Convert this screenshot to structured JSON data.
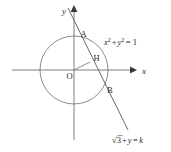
{
  "figure": {
    "background_color": "#ffffff",
    "stroke_color": "#6e6e6e",
    "text_color": "#2b2b2b"
  },
  "axes": {
    "x_label": "x",
    "y_label": "y",
    "origin_label": "O",
    "x_axis_y": 70,
    "y_axis_x": 74,
    "x_axis_start": 12,
    "x_axis_end": 134,
    "y_axis_top": 8,
    "y_axis_bottom": 140
  },
  "circle": {
    "center_x": 74,
    "center_y": 70,
    "radius": 34,
    "equation": "x² + y² = 1",
    "equation_parts": {
      "x_var": "x",
      "x_exp": "2",
      "plus": "+",
      "y_var": "y",
      "y_exp": "2",
      "equals": "= 1"
    }
  },
  "line": {
    "equation": "√3 + y = k",
    "equation_parts": {
      "radical": "√",
      "radicand": "3",
      "plus": "+",
      "y_var": "y",
      "equals": "=",
      "k_var": "k"
    },
    "x1": 68,
    "y1": 8,
    "x2": 128,
    "y2": 130
  },
  "points": [
    {
      "name": "A",
      "label": "A",
      "x": 76.5,
      "y": 37.5,
      "label_dx": 4,
      "label_dy": -1
    },
    {
      "name": "H",
      "label": "H",
      "x": 90.0,
      "y": 62.0,
      "label_dx": 3.5,
      "label_dy": -1.5
    },
    {
      "name": "B",
      "label": "B",
      "x": 103.0,
      "y": 89.0,
      "label_dx": 4,
      "label_dy": 3.5
    },
    {
      "name": "O",
      "label": "O",
      "x": 74,
      "y": 70,
      "label_dx": -7.5,
      "label_dy": 9
    }
  ],
  "segments": [
    {
      "name": "origin-to-H",
      "x1": 74,
      "y1": 70,
      "x2": 90,
      "y2": 62
    }
  ]
}
